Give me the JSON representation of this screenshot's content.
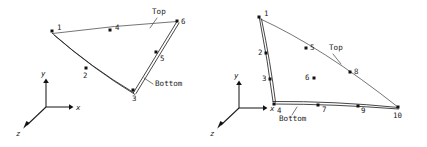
{
  "figure": {
    "background_color": "#ffffff",
    "ink_color": "#1a1a1a",
    "panels": [
      {
        "id": "left-panel",
        "name": "six-node-surface-patch",
        "annotations": [
          {
            "id": "top",
            "label": "Top",
            "x": 152,
            "y": 14,
            "leader": "M 157 18 L 150 28"
          },
          {
            "id": "bottom",
            "label": "Bottom",
            "x": 155,
            "y": 86,
            "leader": "M 153 84 L 144 78"
          }
        ],
        "nodes": [
          {
            "id": "1",
            "label": "1",
            "x": 52.5,
            "y": 31.5,
            "lx": 57,
            "ly": 30
          },
          {
            "id": "2",
            "label": "2",
            "x": 86.5,
            "y": 68.5,
            "lx": 83,
            "ly": 78
          },
          {
            "id": "3",
            "label": "3",
            "x": 133.5,
            "y": 90.5,
            "lx": 132,
            "ly": 101
          },
          {
            "id": "4",
            "label": "4",
            "x": 110.5,
            "y": 30.5,
            "lx": 115,
            "ly": 30
          },
          {
            "id": "5",
            "label": "5",
            "x": 156.5,
            "y": 52.5,
            "lx": 160,
            "ly": 61
          },
          {
            "id": "6",
            "label": "6",
            "x": 177.5,
            "y": 21.5,
            "lx": 181,
            "ly": 24
          }
        ],
        "edges": [
          {
            "id": "top-edge",
            "kind": "single",
            "path": "M 52.5 33.5 Q 114 25.5 177 21.5"
          },
          {
            "id": "bottom-edge-outer",
            "kind": "double",
            "path": "M 52.5 33.5 Q 92 68 133.5 92.5"
          },
          {
            "id": "bottom-edge-inner",
            "kind": "double",
            "path": "M 54.5 35.5 Q 94 69.5 135 94.5"
          },
          {
            "id": "right-edge-outer",
            "kind": "double",
            "path": "M 133.5 92.5 L 177 21.5"
          },
          {
            "id": "right-edge-inner",
            "kind": "double",
            "path": "M 136 93.5 L 179 23"
          }
        ],
        "axes": {
          "origin": {
            "x": 46,
            "y": 107
          },
          "x": {
            "label": "x",
            "tip": {
              "x": 72,
              "y": 107
            },
            "lx": 76,
            "ly": 110
          },
          "y": {
            "label": "y",
            "tip": {
              "x": 46,
              "y": 80
            },
            "lx": 42,
            "ly": 76
          },
          "z": {
            "label": "z",
            "tip": {
              "x": 24,
              "y": 128
            },
            "lx": 18,
            "ly": 135
          }
        }
      },
      {
        "id": "right-panel",
        "name": "ten-node-surface-patch",
        "annotations": [
          {
            "id": "top",
            "label": "Top",
            "x": 329,
            "y": 50,
            "leader": "M 333 54 L 341 64"
          },
          {
            "id": "bottom",
            "label": "Bottom",
            "x": 279,
            "y": 121,
            "leader": "M 292 115 L 297 107"
          }
        ],
        "nodes": [
          {
            "id": "1",
            "label": "1",
            "x": 259.5,
            "y": 17.5,
            "lx": 264,
            "ly": 16
          },
          {
            "id": "2",
            "label": "2",
            "x": 266.5,
            "y": 53.5,
            "lx": 260,
            "ly": 54
          },
          {
            "id": "3",
            "label": "3",
            "x": 270.5,
            "y": 79.5,
            "lx": 264,
            "ly": 80
          },
          {
            "id": "4",
            "label": "4",
            "x": 274.5,
            "y": 104.5,
            "lx": 276,
            "ly": 113
          },
          {
            "id": "5",
            "label": "5",
            "x": 306.5,
            "y": 48.5,
            "lx": 310,
            "ly": 50
          },
          {
            "id": "6",
            "label": "6",
            "x": 314.5,
            "y": 78.5,
            "lx": 306,
            "ly": 79
          },
          {
            "id": "7",
            "label": "7",
            "x": 318.5,
            "y": 105.5,
            "lx": 322,
            "ly": 112
          },
          {
            "id": "8",
            "label": "8",
            "x": 350.5,
            "y": 72.5,
            "lx": 354,
            "ly": 73
          },
          {
            "id": "9",
            "label": "9",
            "x": 358.5,
            "y": 106.5,
            "lx": 361,
            "ly": 113
          },
          {
            "id": "10",
            "label": "10",
            "x": 398.5,
            "y": 107.5,
            "lx": 394,
            "ly": 118
          }
        ],
        "edges": [
          {
            "id": "top-edge",
            "kind": "single",
            "path": "M 259.5 18.5 Q 322 47 398.5 107.5"
          },
          {
            "id": "left-edge-outer",
            "kind": "double",
            "path": "M 259.5 18.5 Q 268 62 273 101.5"
          },
          {
            "id": "left-edge-inner",
            "kind": "double",
            "path": "M 261.5 19 Q 270.5 62.5 275.5 102"
          },
          {
            "id": "bottom-edge-outer",
            "kind": "double",
            "path": "M 273 101.5 Q 334 101 398.5 107.5"
          },
          {
            "id": "bottom-edge-inner",
            "kind": "double",
            "path": "M 273.5 104 Q 334 104 398.5 109"
          }
        ],
        "axes": {
          "origin": {
            "x": 239,
            "y": 108
          },
          "x": {
            "label": "x",
            "tip": {
              "x": 266,
              "y": 108
            },
            "lx": 270,
            "ly": 111
          },
          "y": {
            "label": "y",
            "tip": {
              "x": 239,
              "y": 82
            },
            "lx": 235,
            "ly": 78
          },
          "z": {
            "label": "z",
            "tip": {
              "x": 218,
              "y": 128
            },
            "lx": 212,
            "ly": 135
          }
        }
      }
    ]
  }
}
